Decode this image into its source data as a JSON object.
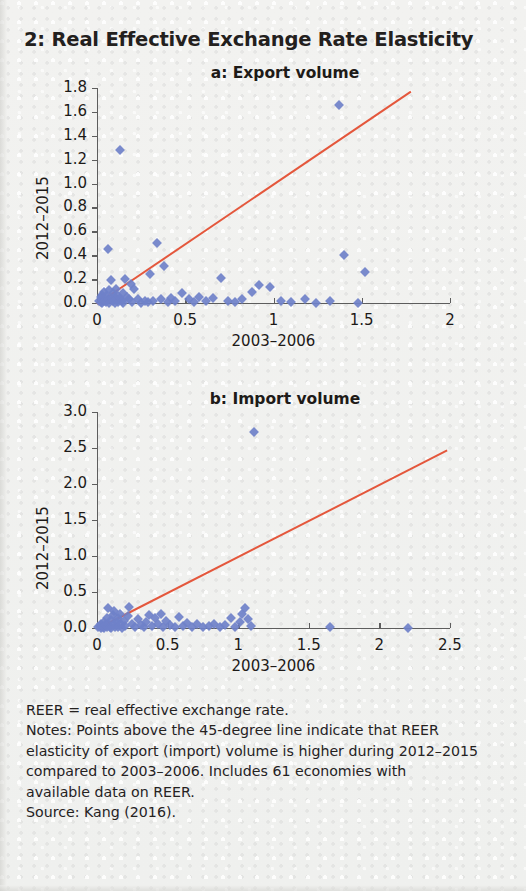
{
  "figure": {
    "title": "2: Real Effective Exchange Rate Elasticity",
    "accent_line_color": "#e4573c",
    "marker_color": "#6f81c9"
  },
  "notes": {
    "line1": "REER = real effective exchange rate.",
    "line2": "Notes: Points above the 45-degree line indicate that REER",
    "line3": "elasticity of export (import) volume is higher during 2012–2015",
    "line4": "compared to 2003–2006. Includes 61 economies with",
    "line5": "available data on REER.",
    "line6": "Source: Kang (2016)."
  },
  "chart_data": [
    {
      "type": "scatter",
      "id": "panel-a",
      "title": "a: Export volume",
      "xlabel": "2003–2006",
      "ylabel": "2012–2015",
      "xlim": [
        0,
        2
      ],
      "ylim": [
        0,
        1.8
      ],
      "xticks": [
        0,
        0.5,
        1,
        1.5,
        2
      ],
      "xticklabels": [
        "0",
        "0.5",
        "1",
        "1.5",
        "2"
      ],
      "yticks": [
        0.0,
        0.2,
        0.4,
        0.6,
        0.8,
        1.0,
        1.2,
        1.4,
        1.6,
        1.8
      ],
      "yticklabels": [
        "0.0",
        "0.2",
        "0.4",
        "0.6",
        "0.8",
        "1.0",
        "1.2",
        "1.4",
        "1.6",
        "1.8"
      ],
      "grid": false,
      "legend": "none",
      "reference_line": {
        "label": "45-degree line",
        "color": "#e4573c",
        "x": [
          0,
          1.78
        ],
        "y": [
          0,
          1.78
        ]
      },
      "points": [
        [
          0.01,
          0.02
        ],
        [
          0.02,
          0.01
        ],
        [
          0.02,
          0.05
        ],
        [
          0.03,
          0.0
        ],
        [
          0.03,
          0.07
        ],
        [
          0.04,
          0.02
        ],
        [
          0.04,
          0.09
        ],
        [
          0.05,
          0.01
        ],
        [
          0.05,
          0.06
        ],
        [
          0.06,
          0.03
        ],
        [
          0.06,
          0.45
        ],
        [
          0.07,
          0.0
        ],
        [
          0.07,
          0.11
        ],
        [
          0.08,
          0.04
        ],
        [
          0.08,
          0.19
        ],
        [
          0.09,
          0.02
        ],
        [
          0.09,
          0.08
        ],
        [
          0.1,
          0.0
        ],
        [
          0.1,
          0.05
        ],
        [
          0.11,
          0.03
        ],
        [
          0.11,
          0.12
        ],
        [
          0.12,
          0.01
        ],
        [
          0.12,
          0.06
        ],
        [
          0.13,
          0.04
        ],
        [
          0.13,
          1.28
        ],
        [
          0.14,
          0.02
        ],
        [
          0.15,
          0.08
        ],
        [
          0.15,
          0.0
        ],
        [
          0.16,
          0.2
        ],
        [
          0.17,
          0.05
        ],
        [
          0.18,
          0.03
        ],
        [
          0.19,
          0.16
        ],
        [
          0.2,
          0.01
        ],
        [
          0.21,
          0.12
        ],
        [
          0.23,
          0.03
        ],
        [
          0.25,
          0.0
        ],
        [
          0.27,
          0.02
        ],
        [
          0.29,
          0.01
        ],
        [
          0.3,
          0.24
        ],
        [
          0.32,
          0.02
        ],
        [
          0.34,
          0.5
        ],
        [
          0.36,
          0.03
        ],
        [
          0.38,
          0.31
        ],
        [
          0.4,
          0.01
        ],
        [
          0.42,
          0.04
        ],
        [
          0.44,
          0.02
        ],
        [
          0.48,
          0.08
        ],
        [
          0.52,
          0.03
        ],
        [
          0.55,
          0.01
        ],
        [
          0.58,
          0.05
        ],
        [
          0.62,
          0.02
        ],
        [
          0.66,
          0.04
        ],
        [
          0.7,
          0.21
        ],
        [
          0.74,
          0.02
        ],
        [
          0.78,
          0.01
        ],
        [
          0.82,
          0.03
        ],
        [
          0.88,
          0.09
        ],
        [
          0.92,
          0.15
        ],
        [
          0.98,
          0.13
        ],
        [
          1.04,
          0.02
        ],
        [
          1.1,
          0.01
        ],
        [
          1.18,
          0.03
        ],
        [
          1.24,
          0.0
        ],
        [
          1.32,
          0.02
        ],
        [
          1.37,
          1.66
        ],
        [
          1.4,
          0.4
        ],
        [
          1.48,
          0.0
        ],
        [
          1.52,
          0.26
        ]
      ]
    },
    {
      "type": "scatter",
      "id": "panel-b",
      "title": "b: Import volume",
      "xlabel": "2003–2006",
      "ylabel": "2012–2015",
      "xlim": [
        0,
        2.5
      ],
      "ylim": [
        0,
        3.0
      ],
      "xticks": [
        0,
        0.5,
        1,
        1.5,
        2,
        2.5
      ],
      "xticklabels": [
        "0",
        "0.5",
        "1",
        "1.5",
        "2",
        "2.5"
      ],
      "yticks": [
        0.0,
        0.5,
        1.0,
        1.5,
        2.0,
        2.5,
        3.0
      ],
      "yticklabels": [
        "0.0",
        "0.5",
        "1.0",
        "1.5",
        "2.0",
        "2.5",
        "3.0"
      ],
      "grid": false,
      "legend": "none",
      "reference_line": {
        "label": "45-degree line",
        "color": "#e4573c",
        "x": [
          0,
          2.48
        ],
        "y": [
          0,
          2.48
        ]
      },
      "points": [
        [
          0.01,
          0.01
        ],
        [
          0.02,
          0.03
        ],
        [
          0.03,
          0.0
        ],
        [
          0.03,
          0.06
        ],
        [
          0.04,
          0.02
        ],
        [
          0.05,
          0.09
        ],
        [
          0.05,
          0.0
        ],
        [
          0.06,
          0.04
        ],
        [
          0.07,
          0.14
        ],
        [
          0.07,
          0.01
        ],
        [
          0.08,
          0.06
        ],
        [
          0.08,
          0.28
        ],
        [
          0.09,
          0.02
        ],
        [
          0.1,
          0.11
        ],
        [
          0.1,
          0.0
        ],
        [
          0.11,
          0.18
        ],
        [
          0.12,
          0.05
        ],
        [
          0.12,
          0.23
        ],
        [
          0.13,
          0.01
        ],
        [
          0.14,
          0.08
        ],
        [
          0.15,
          0.14
        ],
        [
          0.15,
          0.02
        ],
        [
          0.16,
          0.2
        ],
        [
          0.17,
          0.05
        ],
        [
          0.18,
          0.0
        ],
        [
          0.19,
          0.1
        ],
        [
          0.2,
          0.03
        ],
        [
          0.22,
          0.16
        ],
        [
          0.23,
          0.29
        ],
        [
          0.25,
          0.06
        ],
        [
          0.27,
          0.02
        ],
        [
          0.29,
          0.12
        ],
        [
          0.31,
          0.04
        ],
        [
          0.33,
          0.01
        ],
        [
          0.35,
          0.09
        ],
        [
          0.37,
          0.18
        ],
        [
          0.39,
          0.03
        ],
        [
          0.41,
          0.14
        ],
        [
          0.43,
          0.06
        ],
        [
          0.45,
          0.2
        ],
        [
          0.47,
          0.02
        ],
        [
          0.49,
          0.1
        ],
        [
          0.52,
          0.04
        ],
        [
          0.55,
          0.01
        ],
        [
          0.58,
          0.15
        ],
        [
          0.61,
          0.03
        ],
        [
          0.64,
          0.07
        ],
        [
          0.67,
          0.02
        ],
        [
          0.71,
          0.05
        ],
        [
          0.75,
          0.01
        ],
        [
          0.79,
          0.03
        ],
        [
          0.83,
          0.06
        ],
        [
          0.87,
          0.02
        ],
        [
          0.91,
          0.04
        ],
        [
          0.95,
          0.14
        ],
        [
          0.98,
          0.02
        ],
        [
          1.01,
          0.08
        ],
        [
          1.03,
          0.19
        ],
        [
          1.05,
          0.28
        ],
        [
          1.07,
          0.12
        ],
        [
          1.09,
          0.03
        ],
        [
          1.11,
          2.72
        ],
        [
          1.65,
          0.01
        ],
        [
          2.2,
          0.0
        ]
      ]
    }
  ]
}
